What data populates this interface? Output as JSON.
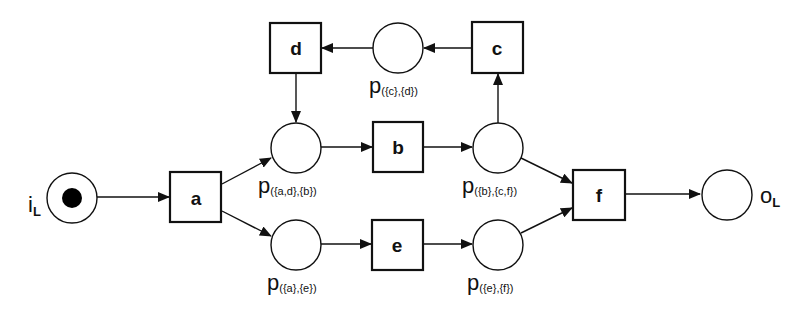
{
  "diagram": {
    "type": "petri-net",
    "colors": {
      "stroke": "#111111",
      "background": "#ffffff",
      "token": "#000000"
    },
    "places": [
      {
        "id": "iL",
        "label_main": "i",
        "label_sub": "L",
        "cx": 72,
        "cy": 198,
        "tokens": 1
      },
      {
        "id": "p_ad_b",
        "label_main": "p",
        "label_sub": "({a,d},{b})",
        "cx": 295,
        "cy": 148,
        "tokens": 0
      },
      {
        "id": "p_a_e",
        "label_main": "p",
        "label_sub": "({a},{e})",
        "cx": 295,
        "cy": 245,
        "tokens": 0
      },
      {
        "id": "p_c_d",
        "label_main": "p",
        "label_sub": "({c},{d})",
        "cx": 398,
        "cy": 48,
        "tokens": 0
      },
      {
        "id": "p_b_cf",
        "label_main": "p",
        "label_sub": "({b},{c,f})",
        "cx": 498,
        "cy": 148,
        "tokens": 0
      },
      {
        "id": "p_e_f",
        "label_main": "p",
        "label_sub": "({e},{f})",
        "cx": 498,
        "cy": 245,
        "tokens": 0
      },
      {
        "id": "oL",
        "label_main": "o",
        "label_sub": "L",
        "cx": 726,
        "cy": 195,
        "tokens": 0
      }
    ],
    "transitions": [
      {
        "id": "a",
        "label": "a",
        "x": 170,
        "y": 172
      },
      {
        "id": "b",
        "label": "b",
        "x": 373,
        "y": 122
      },
      {
        "id": "c",
        "label": "c",
        "x": 472,
        "y": 22
      },
      {
        "id": "d",
        "label": "d",
        "x": 270,
        "y": 23
      },
      {
        "id": "e",
        "label": "e",
        "x": 372,
        "y": 220
      },
      {
        "id": "f",
        "label": "f",
        "x": 573,
        "y": 170
      }
    ],
    "arcs": [
      {
        "from": "iL",
        "to": "a"
      },
      {
        "from": "a",
        "to": "p_ad_b"
      },
      {
        "from": "a",
        "to": "p_a_e"
      },
      {
        "from": "d",
        "to": "p_ad_b"
      },
      {
        "from": "p_ad_b",
        "to": "b"
      },
      {
        "from": "b",
        "to": "p_b_cf"
      },
      {
        "from": "p_b_cf",
        "to": "c"
      },
      {
        "from": "c",
        "to": "p_c_d"
      },
      {
        "from": "p_c_d",
        "to": "d"
      },
      {
        "from": "p_b_cf",
        "to": "f"
      },
      {
        "from": "p_a_e",
        "to": "e"
      },
      {
        "from": "e",
        "to": "p_e_f"
      },
      {
        "from": "p_e_f",
        "to": "f"
      },
      {
        "from": "f",
        "to": "oL"
      }
    ]
  },
  "labels": {
    "iL": {
      "main": "i",
      "sub": "L"
    },
    "oL": {
      "main": "o",
      "sub": "L"
    },
    "p_ad_b": {
      "main": "p",
      "sub": "({a,d},{b})"
    },
    "p_a_e": {
      "main": "p",
      "sub": "({a},{e})"
    },
    "p_c_d": {
      "main": "p",
      "sub": "({c},{d})"
    },
    "p_b_cf": {
      "main": "p",
      "sub": "({b},{c,f})"
    },
    "p_e_f": {
      "main": "p",
      "sub": "({e},{f})"
    },
    "t_a": "a",
    "t_b": "b",
    "t_c": "c",
    "t_d": "d",
    "t_e": "e",
    "t_f": "f"
  }
}
